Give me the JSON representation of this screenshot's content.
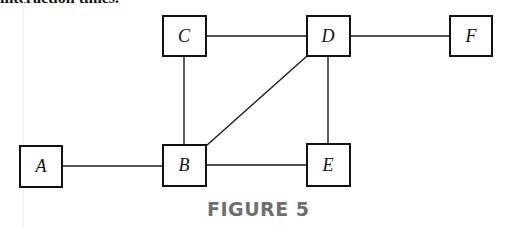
{
  "header": {
    "cut_text": "interaction times."
  },
  "diagram": {
    "nodes": [
      {
        "id": "A",
        "label": "A",
        "x": 20,
        "y": 146,
        "w": 42,
        "h": 41
      },
      {
        "id": "B",
        "label": "B",
        "x": 163,
        "y": 145,
        "w": 43,
        "h": 41
      },
      {
        "id": "C",
        "label": "C",
        "x": 163,
        "y": 16,
        "w": 43,
        "h": 40
      },
      {
        "id": "D",
        "label": "D",
        "x": 307,
        "y": 16,
        "w": 43,
        "h": 40
      },
      {
        "id": "E",
        "label": "E",
        "x": 307,
        "y": 144,
        "w": 43,
        "h": 42
      },
      {
        "id": "F",
        "label": "F",
        "x": 450,
        "y": 16,
        "w": 42,
        "h": 40
      }
    ],
    "edges": [
      {
        "from": "A",
        "to": "B"
      },
      {
        "from": "B",
        "to": "C"
      },
      {
        "from": "B",
        "to": "D"
      },
      {
        "from": "B",
        "to": "E"
      },
      {
        "from": "C",
        "to": "D"
      },
      {
        "from": "D",
        "to": "E"
      },
      {
        "from": "D",
        "to": "F"
      }
    ],
    "stroke_color": "#111111"
  },
  "caption": {
    "text": "FIGURE 5",
    "color": "#6f6f6f"
  }
}
